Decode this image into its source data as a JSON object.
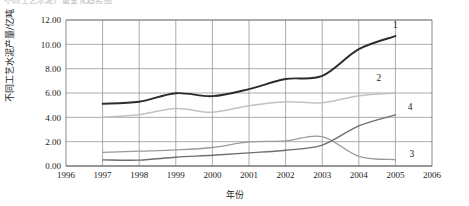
{
  "figure": {
    "top_caption_fragment": "不同工艺水泥产量变化趋势图",
    "background_color": "#ffffff"
  },
  "chart_data": {
    "type": "line",
    "title": "",
    "subtitle": "",
    "xlabel": "年份",
    "ylabel": "不同工艺水泥产量/亿吨",
    "xlim": [
      1996,
      2006
    ],
    "ylim": [
      0.0,
      12.0
    ],
    "x_ticks": [
      1996,
      1997,
      1998,
      1999,
      2000,
      2001,
      2002,
      2003,
      2004,
      2005,
      2006
    ],
    "x_tick_labels": [
      "1996",
      "1997",
      "1998",
      "1999",
      "2000",
      "2001",
      "2002",
      "2003",
      "2004",
      "2005",
      "2006"
    ],
    "y_ticks": [
      0.0,
      2.0,
      4.0,
      6.0,
      8.0,
      10.0,
      12.0
    ],
    "y_tick_labels": [
      "0.00",
      "2.00",
      "4.00",
      "6.00",
      "8.00",
      "10.00",
      "12.00"
    ],
    "grid": true,
    "grid_axis": "both",
    "legend_position": "inline-right-end-labels",
    "x": [
      1997,
      1998,
      1999,
      2000,
      2001,
      2002,
      2003,
      2004,
      2005
    ],
    "series": [
      {
        "name": "1",
        "label": "1",
        "color": "#2b2b2b",
        "values": [
          5.12,
          5.28,
          5.98,
          5.74,
          6.32,
          7.15,
          7.4,
          9.6,
          10.68
        ],
        "label_x": 2005.0,
        "label_y": 11.35
      },
      {
        "name": "2",
        "label": "2",
        "color": "#c2c2c2",
        "values": [
          4.02,
          4.22,
          4.72,
          4.42,
          4.96,
          5.28,
          5.2,
          5.78,
          6.0
        ],
        "label_x": 2004.55,
        "label_y": 6.95
      },
      {
        "name": "3",
        "label": "3",
        "color": "#9a9a9a",
        "values": [
          1.12,
          1.22,
          1.32,
          1.52,
          1.98,
          2.06,
          2.42,
          0.8,
          0.52
        ],
        "label_x": 2005.45,
        "label_y": 0.72
      },
      {
        "name": "4",
        "label": "4",
        "color": "#6e6e6e",
        "values": [
          0.5,
          0.48,
          0.72,
          0.88,
          1.08,
          1.3,
          1.72,
          3.3,
          4.2
        ],
        "label_x": 2005.4,
        "label_y": 4.62
      }
    ]
  }
}
